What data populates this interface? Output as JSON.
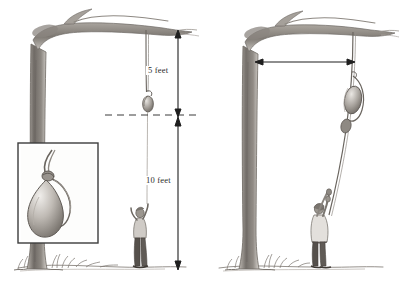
{
  "figure": {
    "background_color": "#ffffff",
    "ink_color": "#57534f",
    "dim_color": "#2b2b2b"
  },
  "panel_left": {
    "name": "Rest position with vertical measurements",
    "dimensions": [
      {
        "id": "five-feet",
        "label": "5 feet",
        "orientation": "vertical",
        "from": "branch",
        "to": "dashed reference line"
      },
      {
        "id": "ten-feet-vertical",
        "label": "10 feet",
        "orientation": "vertical",
        "from": "dashed reference line",
        "to": "ground"
      }
    ],
    "inset": {
      "name": "magnified bob and rope loop",
      "border": true
    },
    "person": {
      "pose": "standing, reaching up to bob"
    },
    "reference_line": {
      "style": "dashed",
      "label": ""
    }
  },
  "panel_right": {
    "name": "Displaced position with horizontal measurement",
    "dimensions": [
      {
        "id": "ten-feet-horizontal",
        "label": "10 feet",
        "orientation": "horizontal",
        "from": "tree trunk",
        "to": "rope"
      }
    ],
    "person": {
      "pose": "arms raised, holding rope"
    }
  },
  "labels": {
    "five_feet": "5 feet",
    "ten_feet_vertical": "10 feet",
    "ten_feet_horizontal": "10 feet"
  }
}
